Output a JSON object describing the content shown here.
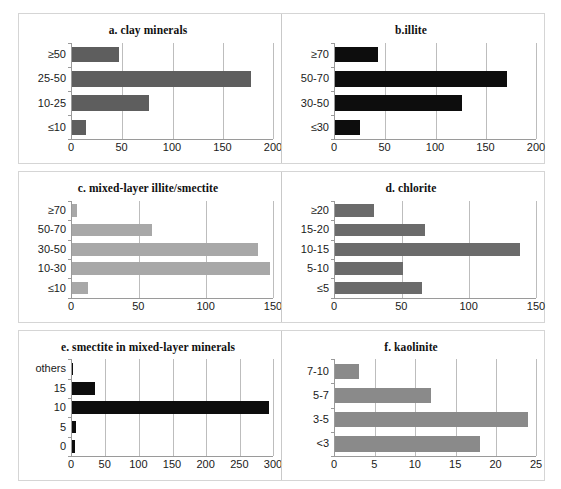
{
  "figure": {
    "background": "#ffffff",
    "panel_border_color": "#d5d5d5",
    "axis_color": "#9a9a9a",
    "gridline_color": "#bdbdbd"
  },
  "chart_data": [
    {
      "id": "a",
      "type": "bar",
      "orientation": "horizontal",
      "title": "a. clay minerals",
      "xlabel": "",
      "ylabel": "",
      "categories": [
        "≥50",
        "25-50",
        "10-25",
        "≤10"
      ],
      "values": [
        47,
        178,
        77,
        14
      ],
      "xlim": [
        0,
        200
      ],
      "xticks": [
        0,
        50,
        100,
        150,
        200
      ],
      "xticklabels": [
        "0",
        "50",
        "100",
        "150",
        "200"
      ],
      "grid": true,
      "legend": "none",
      "bar_color": "#5e5e5e"
    },
    {
      "id": "b",
      "type": "bar",
      "orientation": "horizontal",
      "title": "b.illite",
      "xlabel": "",
      "ylabel": "",
      "categories": [
        "≥70",
        "50-70",
        "30-50",
        "≤30"
      ],
      "values": [
        43,
        171,
        126,
        25
      ],
      "xlim": [
        0,
        200
      ],
      "xticks": [
        0,
        50,
        100,
        150,
        200
      ],
      "xticklabels": [
        "0",
        "50",
        "100",
        "150",
        "200"
      ],
      "grid": true,
      "legend": "none",
      "bar_color": "#0d0d0d"
    },
    {
      "id": "c",
      "type": "bar",
      "orientation": "horizontal",
      "title": "c.  mixed-layer illite/smectite",
      "xlabel": "",
      "ylabel": "",
      "categories": [
        "≥70",
        "50-70",
        "30-50",
        "10-30",
        "≤10"
      ],
      "values": [
        4,
        60,
        139,
        148,
        12
      ],
      "xlim": [
        0,
        150
      ],
      "xticks": [
        0,
        50,
        100,
        150
      ],
      "xticklabels": [
        "0",
        "50",
        "100",
        "150"
      ],
      "grid": true,
      "legend": "none",
      "bar_color": "#a8a8a8"
    },
    {
      "id": "d",
      "type": "bar",
      "orientation": "horizontal",
      "title": "d. chlorite",
      "xlabel": "",
      "ylabel": "",
      "categories": [
        "≥20",
        "15-20",
        "10-15",
        "5-10",
        "≤5"
      ],
      "values": [
        29,
        67,
        138,
        51,
        65
      ],
      "xlim": [
        0,
        150
      ],
      "xticks": [
        0,
        50,
        100,
        150
      ],
      "xticklabels": [
        "0",
        "50",
        "100",
        "150"
      ],
      "grid": true,
      "legend": "none",
      "bar_color": "#6b6b6b"
    },
    {
      "id": "e",
      "type": "bar",
      "orientation": "horizontal",
      "title": "e. smectite in mixed-layer minerals",
      "xlabel": "",
      "ylabel": "",
      "categories": [
        "others",
        "15",
        "10",
        "5",
        "0"
      ],
      "values": [
        2,
        35,
        294,
        6,
        4
      ],
      "xlim": [
        0,
        300
      ],
      "xticks": [
        0,
        50,
        100,
        150,
        200,
        250,
        300
      ],
      "xticklabels": [
        "0",
        "50",
        "100",
        "150",
        "200",
        "250",
        "300"
      ],
      "grid": true,
      "legend": "none",
      "bar_color": "#0d0d0d"
    },
    {
      "id": "f",
      "type": "bar",
      "orientation": "horizontal",
      "title": "f. kaolinite",
      "xlabel": "",
      "ylabel": "",
      "categories": [
        "7-10",
        "5-7",
        "3-5",
        "<3"
      ],
      "values": [
        3,
        12,
        24,
        18
      ],
      "xlim": [
        0,
        25
      ],
      "xticks": [
        0,
        5,
        10,
        15,
        20,
        25
      ],
      "xticklabels": [
        "0",
        "5",
        "10",
        "15",
        "20",
        "25"
      ],
      "grid": true,
      "legend": "none",
      "bar_color": "#8a8a8a"
    }
  ]
}
